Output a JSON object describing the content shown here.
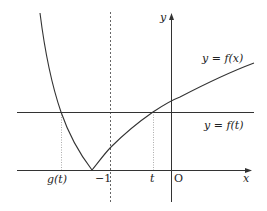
{
  "diagram": {
    "axes": {
      "x_label": "x",
      "y_label": "y",
      "origin_label": "O"
    },
    "curve_label": "y = f(x)",
    "line_label": "y = f(t)",
    "tick_labels": {
      "g_t": "g(t)",
      "minus_one": "−1",
      "t": "t"
    },
    "colors": {
      "stroke": "#333333",
      "guide": "#777777",
      "background": "#ffffff"
    }
  }
}
